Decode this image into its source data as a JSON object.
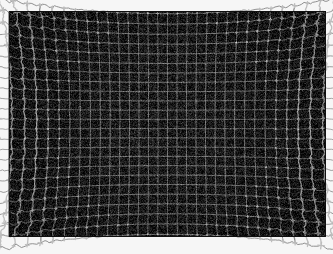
{
  "image": {
    "kind": "photograph",
    "subject": "lens-distortion-calibration-grid",
    "title": "Grid distortion test chart",
    "width": 333,
    "height": 254,
    "page_background": "#f6f6f6"
  },
  "panel": {
    "name": "dark-grid-panel",
    "x": 9,
    "y": 11,
    "width": 317,
    "height": 226,
    "background": "#191919",
    "border_color": "#101010",
    "border_width": 1,
    "inner_margin": 7,
    "vignette_strength": 0.35
  },
  "grid": {
    "name": "distorted-grid",
    "columns": 32,
    "rows": 23,
    "cell_width": 9.6,
    "cell_height": 9.6,
    "line_color": "#bdbdbd",
    "line_color_faint": "#8a8a8a",
    "line_width": 1.0,
    "line_width_edge": 1.3,
    "sample_step": 1.6
  },
  "distortion": {
    "model": "radial-plus-wave",
    "center_x_frac": 0.5,
    "center_y_frac": 0.5,
    "radial_k1": 0.085,
    "radial_k2": 0.125,
    "wave_amplitude": 2.45,
    "wave_frequency_a": 0.62,
    "wave_frequency_b": 0.41,
    "wave_phase_a": 1.17,
    "wave_phase_b": 2.64,
    "radial_falloff_power": 2.6,
    "radial_onset": 0.26,
    "jitter_amplitude": 0.85,
    "overshoot_length": 3.2,
    "overshoot_onset": 0.55
  },
  "noise": {
    "name": "film-grain",
    "amount": 0.16,
    "base_level": 25,
    "speckle_density": 0.11,
    "speckle_level": 58
  },
  "random": {
    "seed": 20240517
  },
  "labels": {
    "alt_text": "Photograph of a black grid calibration chart. The grid lines are straight and regular at the centre of the frame and become increasingly wavy and displaced toward the edges and corners, showing strong radial lens distortion.",
    "caption": "Grid distortion test chart"
  }
}
